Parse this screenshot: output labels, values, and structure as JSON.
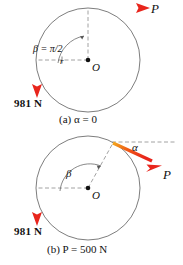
{
  "figure": {
    "title_semantics": "two-panel free-body diagram of a cylinder under applied force P and weight 981 N",
    "colors": {
      "arrow_red": "#e8251c",
      "arrow_orange": "#f5a623",
      "outline_gray": "#6e6e6e",
      "dash_gray": "#8a8a8a",
      "text_black": "#111111"
    },
    "panels": [
      {
        "id": "a",
        "caption_prefix": "(a)",
        "caption_text": "α = 0",
        "caption_full": "(a) α = 0",
        "center_label": "O",
        "applied_force_label": "P",
        "weight_label": "981 N",
        "beta_label": "β = π/2",
        "radius_tick_label": "r",
        "applied_force_direction": "horizontal-right",
        "weight_direction": "vertical-down"
      },
      {
        "id": "b",
        "caption_prefix": "(b)",
        "caption_text": "P = 500 N",
        "caption_full": "(b) P = 500 N",
        "center_label": "O",
        "applied_force_label": "P",
        "weight_label": "981 N",
        "beta_label": "β",
        "alpha_label": "α",
        "applied_force_direction": "down-right at angle alpha below horizontal",
        "weight_direction": "vertical-down"
      }
    ]
  }
}
